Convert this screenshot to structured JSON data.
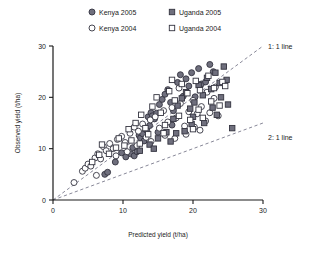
{
  "chart_data": {
    "type": "scatter",
    "title": "",
    "xlabel": "Predicted yield (t/ha)",
    "ylabel": "Observed yield (t/ha)",
    "xlim": [
      0,
      30
    ],
    "ylim": [
      0,
      30
    ],
    "xticks": [
      0,
      10,
      20,
      30
    ],
    "yticks": [
      0,
      10,
      20,
      30
    ],
    "grid": false,
    "legend_position": "top",
    "annotations": [
      {
        "text": "1: 1  line",
        "x": 30,
        "y": 28.5,
        "slope": 1.0,
        "intercept": 0
      },
      {
        "text": "2: 1  line",
        "x": 30,
        "y": 15.2,
        "slope": 0.5,
        "intercept": 0
      }
    ],
    "reference_lines": [
      {
        "name": "1:1 line",
        "slope": 1.0,
        "intercept": 0,
        "style": "dashed",
        "color": "#7a7a8c"
      },
      {
        "name": "2:1 line",
        "slope": 0.5,
        "intercept": 0,
        "style": "dashed",
        "color": "#7a7a8c"
      }
    ],
    "series": [
      {
        "name": "Kenya  2005",
        "marker": "filled-circle",
        "color": "#6b6b7a",
        "edge": "#2e2e3a",
        "points": [
          [
            9.8,
            9.2
          ],
          [
            10.4,
            8.4
          ],
          [
            11.1,
            9.0
          ],
          [
            11.4,
            10.2
          ],
          [
            11.6,
            8.6
          ],
          [
            12.0,
            9.4
          ],
          [
            12.3,
            12.6
          ],
          [
            12.5,
            12.1
          ],
          [
            12.8,
            12.9
          ],
          [
            13.0,
            11.5
          ],
          [
            13.4,
            13.6
          ],
          [
            13.6,
            16.2
          ],
          [
            14.0,
            17.0
          ],
          [
            14.2,
            16.4
          ],
          [
            14.5,
            15.8
          ],
          [
            14.8,
            16.9
          ],
          [
            15.2,
            18.6
          ],
          [
            15.6,
            19.6
          ],
          [
            16.0,
            20.6
          ],
          [
            16.4,
            21.5
          ],
          [
            16.8,
            19.0
          ],
          [
            17.2,
            17.4
          ],
          [
            17.8,
            22.9
          ],
          [
            18.2,
            24.4
          ],
          [
            18.6,
            20.2
          ],
          [
            19.0,
            23.6
          ],
          [
            19.4,
            22.2
          ],
          [
            19.8,
            24.8
          ],
          [
            20.3,
            20.1
          ],
          [
            20.8,
            25.6
          ],
          [
            21.2,
            22.6
          ],
          [
            21.8,
            23.0
          ],
          [
            22.4,
            26.4
          ],
          [
            22.9,
            25.0
          ],
          [
            8.9,
            7.4
          ],
          [
            7.4,
            5.0
          ],
          [
            7.8,
            5.4
          ],
          [
            17.0,
            14.6
          ],
          [
            15.0,
            13.2
          ],
          [
            13.8,
            14.5
          ]
        ]
      },
      {
        "name": "Kenya  2004",
        "marker": "open-circle",
        "color": "#ffffff",
        "edge": "#4a4a56",
        "points": [
          [
            3.0,
            3.4
          ],
          [
            4.2,
            5.6
          ],
          [
            4.6,
            6.2
          ],
          [
            5.0,
            7.0
          ],
          [
            5.4,
            6.6
          ],
          [
            6.0,
            8.2
          ],
          [
            6.4,
            9.0
          ],
          [
            6.8,
            8.0
          ],
          [
            7.2,
            10.4
          ],
          [
            7.6,
            9.6
          ],
          [
            8.1,
            11.0
          ],
          [
            8.6,
            10.0
          ],
          [
            9.2,
            11.8
          ],
          [
            9.8,
            12.4
          ],
          [
            10.3,
            11.2
          ],
          [
            11.0,
            13.0
          ],
          [
            11.6,
            14.2
          ],
          [
            12.2,
            13.4
          ],
          [
            12.8,
            14.8
          ],
          [
            13.3,
            12.2
          ],
          [
            13.9,
            15.6
          ],
          [
            14.6,
            16.2
          ],
          [
            15.2,
            14.0
          ],
          [
            15.8,
            17.4
          ],
          [
            16.4,
            15.2
          ],
          [
            17.0,
            18.0
          ],
          [
            17.6,
            16.0
          ],
          [
            18.2,
            18.8
          ],
          [
            18.8,
            14.4
          ],
          [
            19.4,
            17.2
          ],
          [
            20.0,
            19.4
          ],
          [
            20.6,
            16.8
          ],
          [
            21.2,
            18.2
          ],
          [
            21.8,
            15.4
          ],
          [
            22.4,
            17.0
          ],
          [
            23.0,
            19.8
          ],
          [
            23.6,
            16.4
          ],
          [
            19.0,
            12.8
          ],
          [
            17.4,
            12.0
          ],
          [
            16.0,
            12.6
          ],
          [
            14.0,
            11.4
          ],
          [
            12.0,
            10.6
          ],
          [
            10.6,
            9.4
          ],
          [
            9.0,
            8.6
          ],
          [
            6.2,
            4.8
          ],
          [
            20.2,
            14.2
          ],
          [
            22.0,
            21.0
          ],
          [
            23.2,
            22.0
          ],
          [
            18.0,
            21.8
          ],
          [
            21.0,
            13.6
          ]
        ]
      },
      {
        "name": "Uganda  2005",
        "marker": "filled-square",
        "color": "#7a7a88",
        "edge": "#2e2e3a",
        "points": [
          [
            12.4,
            9.6
          ],
          [
            13.8,
            10.8
          ],
          [
            15.0,
            12.0
          ],
          [
            16.2,
            13.2
          ],
          [
            17.2,
            15.8
          ],
          [
            17.8,
            18.4
          ],
          [
            18.4,
            19.8
          ],
          [
            19.0,
            21.0
          ],
          [
            19.6,
            17.8
          ],
          [
            20.2,
            19.0
          ],
          [
            20.8,
            22.4
          ],
          [
            21.4,
            20.4
          ],
          [
            22.0,
            23.8
          ],
          [
            22.6,
            21.6
          ],
          [
            23.2,
            24.8
          ],
          [
            23.8,
            22.8
          ],
          [
            24.4,
            26.0
          ],
          [
            25.0,
            18.6
          ],
          [
            25.6,
            14.0
          ],
          [
            18.8,
            13.4
          ],
          [
            21.6,
            15.0
          ],
          [
            23.4,
            16.6
          ],
          [
            24.8,
            23.4
          ],
          [
            20.0,
            16.2
          ],
          [
            16.8,
            11.4
          ],
          [
            14.4,
            10.0
          ],
          [
            22.8,
            18.0
          ],
          [
            24.0,
            20.0
          ],
          [
            19.8,
            14.8
          ],
          [
            17.6,
            13.0
          ]
        ]
      },
      {
        "name": "Uganda  2004",
        "marker": "open-square",
        "color": "#ffffff",
        "edge": "#4a4a56",
        "points": [
          [
            5.6,
            7.4
          ],
          [
            6.6,
            8.8
          ],
          [
            7.0,
            10.8
          ],
          [
            8.0,
            9.0
          ],
          [
            9.4,
            12.0
          ],
          [
            10.8,
            13.8
          ],
          [
            11.8,
            15.0
          ],
          [
            12.6,
            16.6
          ],
          [
            13.2,
            14.0
          ],
          [
            14.2,
            18.2
          ],
          [
            14.8,
            20.0
          ],
          [
            15.4,
            17.0
          ],
          [
            16.6,
            21.2
          ],
          [
            17.4,
            19.4
          ],
          [
            18.4,
            22.6
          ],
          [
            19.2,
            20.8
          ],
          [
            20.4,
            23.2
          ],
          [
            21.0,
            21.4
          ],
          [
            22.2,
            24.2
          ],
          [
            23.0,
            21.8
          ],
          [
            24.2,
            23.0
          ],
          [
            18.0,
            16.4
          ],
          [
            19.6,
            15.6
          ],
          [
            20.8,
            17.6
          ],
          [
            22.6,
            19.2
          ],
          [
            16.0,
            14.6
          ],
          [
            13.6,
            12.8
          ],
          [
            11.2,
            11.6
          ],
          [
            9.0,
            10.2
          ],
          [
            21.4,
            16.0
          ],
          [
            23.8,
            18.4
          ],
          [
            15.8,
            13.0
          ],
          [
            12.4,
            11.0
          ],
          [
            10.2,
            10.6
          ],
          [
            24.6,
            22.2
          ],
          [
            17.0,
            23.4
          ],
          [
            20.0,
            13.8
          ]
        ]
      }
    ]
  },
  "legend": {
    "items": [
      {
        "label": "Kenya  2005",
        "marker": "filled-circle"
      },
      {
        "label": "Uganda  2005",
        "marker": "filled-square"
      },
      {
        "label": "Kenya  2004",
        "marker": "open-circle"
      },
      {
        "label": "Uganda  2004",
        "marker": "open-square"
      }
    ]
  },
  "colors": {
    "filled_fill": "#6f6f7d",
    "open_fill": "#ffffff",
    "marker_edge": "#33333f",
    "axis": "#1a1a1a",
    "refline": "#7a7a8c",
    "background": "#ffffff"
  }
}
